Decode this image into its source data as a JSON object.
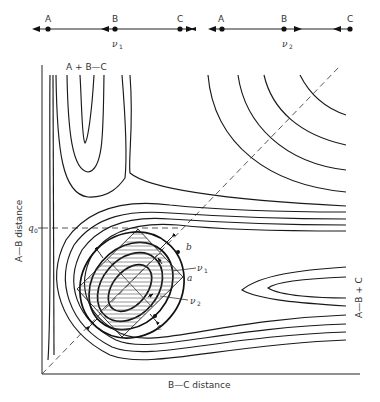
{
  "figure": {
    "type": "potential-energy-surface-contour-diagram",
    "vibration_modes": [
      {
        "label": "ν1",
        "atoms": [
          "A",
          "B",
          "C"
        ],
        "description": "symmetric stretch: A and C move outward, B arrow left"
      },
      {
        "label": "ν2",
        "atoms": [
          "A",
          "B",
          "C"
        ],
        "description": "asymmetric stretch"
      }
    ],
    "axes": {
      "x_label": "B—C distance",
      "y_label": "A—B distance",
      "y_marker": "q0"
    },
    "region_labels": {
      "top": "A + B—C",
      "right": "A—B + C"
    },
    "point_labels": [
      "a",
      "b",
      "c"
    ],
    "mode_labels": [
      "ν1",
      "ν2"
    ]
  },
  "top_diagram": {
    "nu1": {
      "atoms": [
        "A",
        "B",
        "C"
      ],
      "label": "ν",
      "sub": "1"
    },
    "nu2": {
      "atoms": [
        "A",
        "B",
        "C"
      ],
      "label": "ν",
      "sub": "2"
    }
  },
  "labels": {
    "x_axis": "B—C  distance",
    "y_axis": "A—B  distance",
    "q0": "q",
    "q0_sub": "0",
    "top_region": "A + B—C",
    "right_region": "A—B + C",
    "a": "a",
    "b": "b",
    "c": "c",
    "nu": "ν",
    "sub1": "1",
    "sub2": "2"
  }
}
